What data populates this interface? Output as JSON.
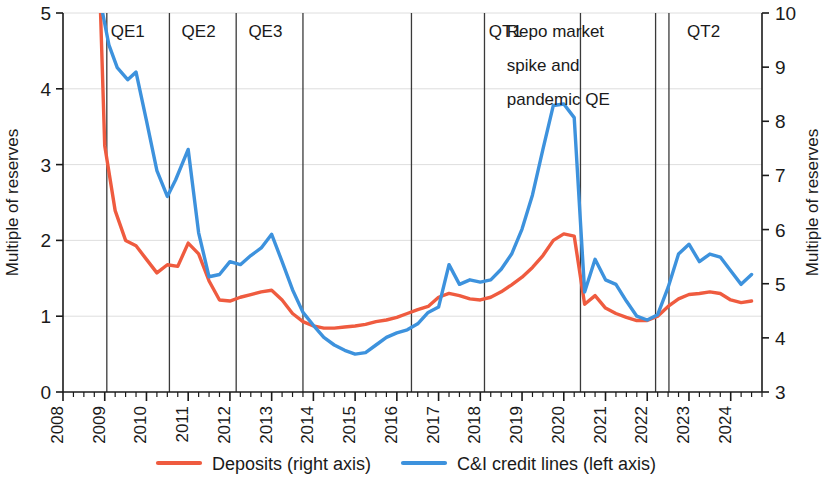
{
  "chart_data": {
    "type": "line",
    "title": "",
    "xlabel": "",
    "ylabel": "Multiple of reserves",
    "y2label": "Multiple of reserves",
    "xlim": [
      2008.0,
      2024.75
    ],
    "ylim": [
      0,
      5
    ],
    "y2lim": [
      3,
      10
    ],
    "grid": true,
    "legend_position": "bottom",
    "left_ticks": [
      "0",
      "1",
      "2",
      "3",
      "4",
      "5"
    ],
    "left_tick_values": [
      0,
      1,
      2,
      3,
      4,
      5
    ],
    "right_ticks": [
      "3",
      "4",
      "5",
      "6",
      "7",
      "8",
      "9",
      "10"
    ],
    "right_tick_values": [
      3,
      4,
      5,
      6,
      7,
      8,
      9,
      10
    ],
    "x_ticks": [
      "2008",
      "2009",
      "2010",
      "2011",
      "2012",
      "2013",
      "2014",
      "2015",
      "2016",
      "2017",
      "2018",
      "2019",
      "2020",
      "2021",
      "2022",
      "2023",
      "2024"
    ],
    "x_tick_values": [
      2008,
      2009,
      2010,
      2011,
      2012,
      2013,
      2014,
      2015,
      2016,
      2017,
      2018,
      2019,
      2020,
      2021,
      2022,
      2023,
      2024
    ],
    "annotations": [
      {
        "label": "QE1",
        "x": 2009.55,
        "y_top": 5.0
      },
      {
        "label": "QE2",
        "x": 2011.25,
        "y_top": 5.0
      },
      {
        "label": "QE3",
        "x": 2012.85,
        "y_top": 5.0
      },
      {
        "label": "QT1",
        "x": 2018.6,
        "y_top": 5.0
      },
      {
        "label": "Repo market",
        "x": 2020.0,
        "y_top": 5.0
      },
      {
        "label": "spike and",
        "x": 2020.0,
        "y_top": 4.55
      },
      {
        "label": "pandemic QE",
        "x": 2020.0,
        "y_top": 4.1
      },
      {
        "label": "QT2",
        "x": 2023.35,
        "y_top": 5.0
      }
    ],
    "dividers_x": [
      2009.05,
      2010.55,
      2012.15,
      2013.75,
      2016.35,
      2018.1,
      2020.4,
      2022.2,
      2022.52
    ],
    "series": [
      {
        "name": "Deposits (right axis)",
        "axis": "right",
        "color": "#ef5b3f",
        "x": [
          2008.9,
          2009.0,
          2009.25,
          2009.5,
          2009.75,
          2010.0,
          2010.25,
          2010.5,
          2010.75,
          2011.0,
          2011.25,
          2011.5,
          2011.75,
          2012.0,
          2012.25,
          2012.5,
          2012.75,
          2013.0,
          2013.25,
          2013.5,
          2013.75,
          2014.0,
          2014.25,
          2014.5,
          2014.75,
          2015.0,
          2015.25,
          2015.5,
          2015.75,
          2016.0,
          2016.25,
          2016.5,
          2016.75,
          2017.0,
          2017.25,
          2017.5,
          2017.75,
          2018.0,
          2018.25,
          2018.5,
          2018.75,
          2019.0,
          2019.25,
          2019.5,
          2019.75,
          2020.0,
          2020.25,
          2020.5,
          2020.75,
          2021.0,
          2021.25,
          2021.5,
          2021.75,
          2022.0,
          2022.25,
          2022.5,
          2022.75,
          2023.0,
          2023.25,
          2023.5,
          2023.75,
          2024.0,
          2024.25,
          2024.5
        ],
        "values": [
          10.0,
          7.55,
          6.35,
          5.8,
          5.7,
          5.45,
          5.2,
          5.35,
          5.32,
          5.75,
          5.55,
          5.05,
          4.7,
          4.68,
          4.75,
          4.8,
          4.85,
          4.88,
          4.7,
          4.45,
          4.3,
          4.22,
          4.18,
          4.18,
          4.2,
          4.22,
          4.25,
          4.3,
          4.33,
          4.38,
          4.45,
          4.52,
          4.58,
          4.75,
          4.82,
          4.78,
          4.72,
          4.7,
          4.75,
          4.85,
          4.98,
          5.12,
          5.3,
          5.52,
          5.8,
          5.92,
          5.88,
          4.62,
          4.78,
          4.55,
          4.45,
          4.38,
          4.32,
          4.32,
          4.4,
          4.58,
          4.72,
          4.8,
          4.82,
          4.85,
          4.82,
          4.7,
          4.65,
          4.68
        ]
      },
      {
        "name": "C&I credit lines (left axis)",
        "axis": "left",
        "color": "#3d92dd",
        "x": [
          2008.95,
          2009.1,
          2009.3,
          2009.55,
          2009.75,
          2010.0,
          2010.25,
          2010.5,
          2010.7,
          2011.0,
          2011.25,
          2011.5,
          2011.75,
          2012.0,
          2012.25,
          2012.5,
          2012.75,
          2013.0,
          2013.25,
          2013.5,
          2013.75,
          2014.0,
          2014.25,
          2014.5,
          2014.75,
          2015.0,
          2015.25,
          2015.5,
          2015.75,
          2016.0,
          2016.25,
          2016.5,
          2016.75,
          2017.0,
          2017.25,
          2017.5,
          2017.75,
          2018.0,
          2018.25,
          2018.5,
          2018.75,
          2019.0,
          2019.25,
          2019.5,
          2019.75,
          2020.0,
          2020.25,
          2020.5,
          2020.75,
          2021.0,
          2021.25,
          2021.5,
          2021.75,
          2022.0,
          2022.25,
          2022.5,
          2022.75,
          2023.0,
          2023.25,
          2023.5,
          2023.75,
          2024.0,
          2024.25,
          2024.5
        ],
        "values": [
          5.0,
          4.58,
          4.28,
          4.12,
          4.22,
          3.58,
          2.92,
          2.58,
          2.8,
          3.2,
          2.1,
          1.52,
          1.55,
          1.72,
          1.68,
          1.8,
          1.9,
          2.08,
          1.72,
          1.35,
          1.05,
          0.88,
          0.72,
          0.62,
          0.55,
          0.5,
          0.52,
          0.62,
          0.72,
          0.78,
          0.82,
          0.9,
          1.05,
          1.12,
          1.68,
          1.42,
          1.48,
          1.45,
          1.48,
          1.62,
          1.82,
          2.15,
          2.6,
          3.2,
          3.78,
          3.8,
          3.62,
          1.32,
          1.75,
          1.48,
          1.42,
          1.2,
          1.0,
          0.95,
          1.02,
          1.38,
          1.82,
          1.95,
          1.72,
          1.82,
          1.78,
          1.6,
          1.42,
          1.55
        ]
      }
    ]
  },
  "legend": {
    "items": [
      {
        "label": "Deposits (right axis)",
        "color": "#ef5b3f"
      },
      {
        "label": "C&I credit lines (left axis)",
        "color": "#3d92dd"
      }
    ]
  },
  "axes": {
    "left_title": "Multiple of reserves",
    "right_title": "Multiple of reserves"
  }
}
